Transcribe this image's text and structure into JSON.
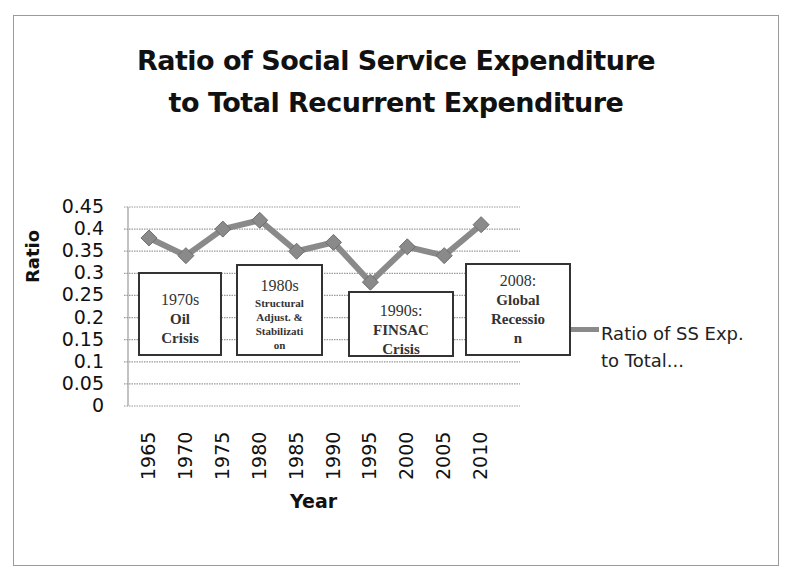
{
  "chart_data": {
    "type": "line",
    "title": "Ratio of Social Service Expenditure to Total Recurrent Expenditure",
    "title_lines": [
      "Ratio of Social Service Expenditure",
      "to Total Recurrent Expenditure"
    ],
    "xlabel": "Year",
    "ylabel": "Ratio",
    "categories": [
      "1965",
      "1970",
      "1975",
      "1980",
      "1985",
      "1990",
      "1995",
      "2000",
      "2005",
      "2010"
    ],
    "series": [
      {
        "name": "Ratio of SS Exp. to Total...",
        "color": "#8a8a8a",
        "marker": "diamond",
        "values": [
          0.38,
          0.34,
          0.4,
          0.42,
          0.35,
          0.37,
          0.28,
          0.36,
          0.34,
          0.41
        ]
      }
    ],
    "ylim": [
      0,
      0.45
    ],
    "yticks": [
      "0.45",
      "0.4",
      "0.35",
      "0.3",
      "0.25",
      "0.2",
      "0.15",
      "0.1",
      "0.05",
      "0"
    ],
    "grid": true,
    "legend_position": "right",
    "legend": {
      "line1": "Ratio of SS Exp.",
      "line2": "to Total..."
    },
    "annotations": [
      {
        "lines": [
          "1970s",
          "Oil",
          "Crisis"
        ]
      },
      {
        "lines": [
          "1980s",
          "Structural",
          "Adjust. &",
          "Stabilizati",
          "on"
        ]
      },
      {
        "lines": [
          "1990s:",
          "FINSAC",
          "Crisis"
        ]
      },
      {
        "lines": [
          "2008:",
          "Global",
          "Recessio",
          "n"
        ]
      }
    ]
  }
}
